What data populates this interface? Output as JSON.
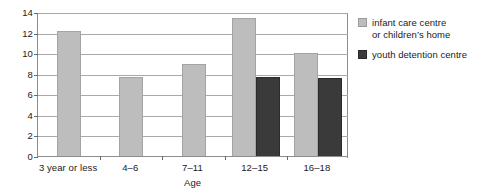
{
  "chart_data": {
    "type": "bar",
    "title": "",
    "xlabel": "Age",
    "ylabel": "",
    "categories": [
      "3 year or less",
      "4–6",
      "7–11",
      "12–15",
      "16–18"
    ],
    "series": [
      {
        "name": "infant care centre or children's home",
        "color": "#bdbdbd",
        "values": [
          12.2,
          7.7,
          8.9,
          13.4,
          10.0
        ]
      },
      {
        "name": "youth detention centre",
        "color": "#3a3a3a",
        "values": [
          null,
          null,
          null,
          7.7,
          7.6
        ]
      }
    ],
    "ylim": [
      0,
      14
    ],
    "ytick_step": 2,
    "yticks": [
      "0",
      "2",
      "4",
      "6",
      "8",
      "10",
      "12",
      "14"
    ],
    "grid": true,
    "legend_position": "right"
  },
  "legend": {
    "entries": [
      {
        "label_line1": "infant care centre",
        "label_line2": "or children’s home",
        "swatch": "light-gray-swatch"
      },
      {
        "label_line1": "youth detention centre",
        "label_line2": "",
        "swatch": "dark-gray-swatch"
      }
    ]
  },
  "axis": {
    "x_title": "Age"
  }
}
